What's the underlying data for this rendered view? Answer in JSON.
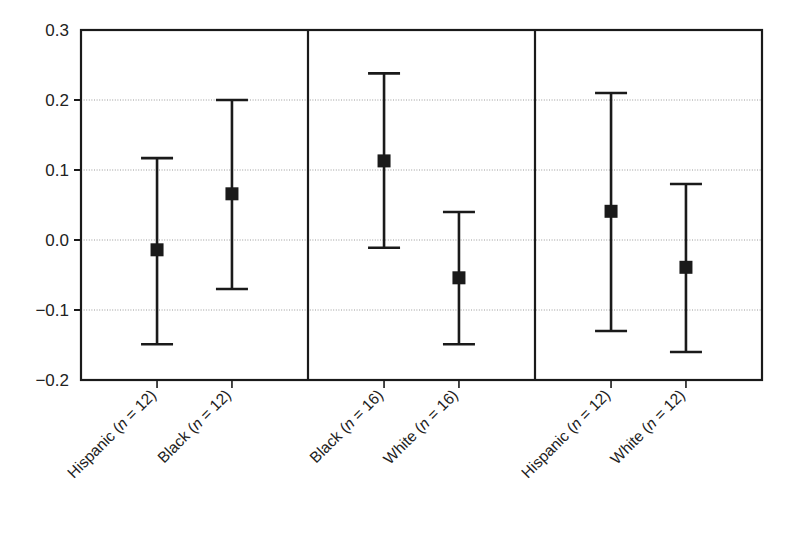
{
  "chart_data": {
    "type": "scatter",
    "title": "",
    "xlabel": "",
    "ylabel": "",
    "ylim": [
      -0.2,
      0.3
    ],
    "yticks": [
      0.3,
      0.2,
      0.1,
      0.0,
      -0.1,
      -0.2
    ],
    "ytick_labels": [
      "0.3",
      "0.2",
      "0.1",
      "0.0",
      "-0.1",
      "-0.2"
    ],
    "grid": true,
    "grid_axis": "y",
    "legend": "none",
    "marker": "filled-square",
    "error_bar_style": "capped-vertical",
    "panel_separators": 2,
    "groups": [
      {
        "name": "group-1",
        "points": [
          {
            "label": "Hispanic (n = 12)",
            "category": "Hispanic",
            "n": 12,
            "value": -0.014,
            "ci_low": -0.149,
            "ci_high": 0.117
          },
          {
            "label": "Black (n = 12)",
            "category": "Black",
            "n": 12,
            "value": 0.066,
            "ci_low": -0.07,
            "ci_high": 0.2
          }
        ]
      },
      {
        "name": "group-2",
        "points": [
          {
            "label": "Black (n = 16)",
            "category": "Black",
            "n": 16,
            "value": 0.113,
            "ci_low": -0.011,
            "ci_high": 0.238
          },
          {
            "label": "White (n = 16)",
            "category": "White",
            "n": 16,
            "value": -0.054,
            "ci_low": -0.149,
            "ci_high": 0.04
          }
        ]
      },
      {
        "name": "group-3",
        "points": [
          {
            "label": "Hispanic (n = 12)",
            "category": "Hispanic",
            "n": 12,
            "value": 0.041,
            "ci_low": -0.13,
            "ci_high": 0.21
          },
          {
            "label": "White (n = 12)",
            "category": "White",
            "n": 12,
            "value": -0.039,
            "ci_low": -0.16,
            "ci_high": 0.08
          }
        ]
      }
    ],
    "xtick_labels": [
      "Hispanic (n = 12)",
      "Black (n = 12)",
      "Black (n = 16)",
      "White (n = 16)",
      "Hispanic (n = 12)",
      "White (n = 12)"
    ],
    "xtick_label_parts": [
      {
        "prefix": "Hispanic (",
        "italic": "n",
        "suffix": " = 12)"
      },
      {
        "prefix": "Black (",
        "italic": "n",
        "suffix": " = 12)"
      },
      {
        "prefix": "Black (",
        "italic": "n",
        "suffix": " = 16)"
      },
      {
        "prefix": "White (",
        "italic": "n",
        "suffix": " = 16)"
      },
      {
        "prefix": "Hispanic (",
        "italic": "n",
        "suffix": " = 12)"
      },
      {
        "prefix": "White (",
        "italic": "n",
        "suffix": " = 12)"
      }
    ]
  },
  "colors": {
    "background": "#ffffff",
    "axis": "#1a1a1a",
    "grid": "#9a9a9a",
    "marker": "#1a1a1a",
    "errorbar": "#1a1a1a",
    "text": "#222222"
  }
}
